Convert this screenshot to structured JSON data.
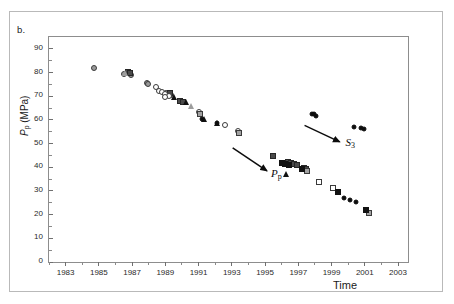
{
  "figure": {
    "panel_label": "b.",
    "background": "#ffffff"
  },
  "axes": {
    "x": {
      "label": "Time",
      "min": 1982,
      "max": 2003.6,
      "major_ticks": [
        1983,
        1985,
        1987,
        1989,
        1991,
        1993,
        1995,
        1997,
        1999,
        2001,
        2003
      ],
      "minor_ticks": [
        1982,
        1984,
        1986,
        1988,
        1990,
        1992,
        1994,
        1996,
        1998,
        2000,
        2002
      ]
    },
    "y": {
      "label_main": "P",
      "label_sub": "p",
      "label_units": " (MPa)",
      "label_full": "Pp (MPa)",
      "min": 0,
      "max": 95,
      "major_ticks": [
        0,
        10,
        20,
        30,
        40,
        50,
        60,
        70,
        80,
        90
      ],
      "minor_ticks": [
        5,
        15,
        25,
        35,
        45,
        55,
        65,
        75,
        85
      ]
    }
  },
  "annotations": [
    {
      "name": "pp-arrow",
      "label_main": "P",
      "label_sub": "p",
      "x1": 1993.05,
      "y1": 48.2,
      "x2": 1995.1,
      "y2": 38.6,
      "lx": 1995.35,
      "ly": 36.2
    },
    {
      "name": "s3-arrow",
      "label_main": "S",
      "label_sub": "3",
      "x1": 1997.35,
      "y1": 57.6,
      "x2": 1999.45,
      "y2": 50.7,
      "lx": 1999.8,
      "ly": 49.0
    }
  ],
  "chart_data": {
    "type": "scatter",
    "title": "",
    "xlabel": "Time",
    "ylabel": "Pp (MPa)",
    "xlim": [
      1982,
      2003.6
    ],
    "ylim": [
      0,
      95
    ],
    "grid": false,
    "legend": "none",
    "series": [
      {
        "name": "gray-circle",
        "marker": "circle",
        "style": "c-gray",
        "size": 6,
        "points": [
          [
            1984.7,
            82.0
          ],
          [
            1986.5,
            79.2
          ],
          [
            1986.95,
            79.0
          ],
          [
            1987.9,
            75.5
          ],
          [
            1987.95,
            75.0
          ],
          [
            1989.05,
            71.2
          ],
          [
            1989.35,
            70.4
          ]
        ]
      },
      {
        "name": "dark-square",
        "marker": "square",
        "style": "s-dark",
        "size": 6,
        "points": [
          [
            1986.75,
            80.1
          ],
          [
            1986.9,
            79.6
          ],
          [
            1989.3,
            71.5
          ],
          [
            1989.9,
            68.0
          ],
          [
            1990.05,
            67.5
          ],
          [
            1995.5,
            44.7
          ],
          [
            1996.35,
            42.1
          ],
          [
            1996.55,
            41.7
          ],
          [
            1996.75,
            41.4
          ],
          [
            1996.95,
            41.0
          ],
          [
            1997.35,
            39.9
          ],
          [
            1997.45,
            39.4
          ]
        ]
      },
      {
        "name": "open-circle",
        "marker": "circle",
        "style": "c-open",
        "size": 6,
        "points": [
          [
            1988.45,
            73.7
          ],
          [
            1988.6,
            72.4
          ],
          [
            1988.8,
            71.8
          ],
          [
            1989.0,
            70.9
          ],
          [
            1989.2,
            70.2
          ],
          [
            1988.95,
            69.6
          ],
          [
            1991.05,
            63.3
          ],
          [
            1992.6,
            57.9
          ],
          [
            1993.35,
            55.5
          ]
        ]
      },
      {
        "name": "filled-triangle",
        "marker": "triangle",
        "style": "t-fill",
        "size": 7,
        "points": [
          [
            1989.55,
            69.5
          ],
          [
            1990.3,
            67.3
          ],
          [
            1991.35,
            60.2
          ],
          [
            1992.15,
            58.4
          ],
          [
            1996.3,
            36.8
          ]
        ]
      },
      {
        "name": "gray-triangle",
        "marker": "triangle",
        "style": "t-gray",
        "size": 7,
        "points": [
          [
            1986.6,
            79.5
          ],
          [
            1990.6,
            65.9
          ]
        ]
      },
      {
        "name": "gray-square",
        "marker": "square",
        "style": "s-gray",
        "size": 6,
        "points": [
          [
            1991.1,
            62.6
          ],
          [
            1993.45,
            54.3
          ],
          [
            1997.55,
            38.4
          ],
          [
            2001.25,
            20.8
          ]
        ]
      },
      {
        "name": "open-square",
        "marker": "square",
        "style": "s-open",
        "size": 6,
        "points": [
          [
            1998.25,
            33.8
          ],
          [
            1999.1,
            31.4
          ]
        ]
      },
      {
        "name": "filled-circle",
        "marker": "circle",
        "style": "c-fill",
        "size": 5,
        "points": [
          [
            1991.2,
            60.3
          ],
          [
            1992.1,
            58.6
          ],
          [
            1997.85,
            62.4
          ],
          [
            1997.95,
            62.6
          ],
          [
            1998.05,
            61.8
          ],
          [
            2000.35,
            57.2
          ],
          [
            2000.75,
            56.4
          ],
          [
            2000.95,
            56.0
          ],
          [
            1999.75,
            27.0
          ],
          [
            2000.1,
            26.0
          ],
          [
            2000.45,
            25.4
          ]
        ]
      },
      {
        "name": "filled-square",
        "marker": "square",
        "style": "s-fill",
        "size": 6,
        "points": [
          [
            1996.0,
            41.9
          ],
          [
            1996.2,
            41.5
          ],
          [
            1996.45,
            41.0
          ],
          [
            1997.25,
            39.2
          ],
          [
            1999.4,
            29.4
          ],
          [
            2001.05,
            21.8
          ]
        ]
      }
    ]
  }
}
